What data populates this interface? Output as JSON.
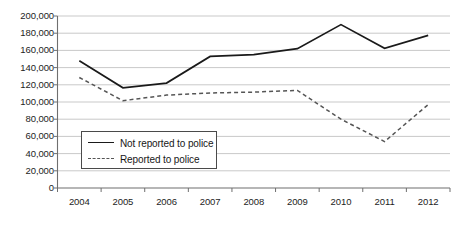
{
  "chart_data": {
    "type": "line",
    "title": "",
    "xlabel": "",
    "ylabel": "",
    "categories": [
      "2004",
      "2005",
      "2006",
      "2007",
      "2008",
      "2009",
      "2010",
      "2011",
      "2012"
    ],
    "x": [
      2004,
      2005,
      2006,
      2007,
      2008,
      2009,
      2010,
      2011,
      2012
    ],
    "ylim": [
      0,
      200000
    ],
    "ytick_step": 20000,
    "yticks": [
      "200,000",
      "180,000",
      "160,000",
      "140,000",
      "120,000",
      "100,000",
      "80,000",
      "60,000",
      "40,000",
      "20,000",
      "0"
    ],
    "ytick_values": [
      200000,
      180000,
      160000,
      140000,
      120000,
      100000,
      80000,
      60000,
      40000,
      20000,
      0
    ],
    "grid": true,
    "grid_axis": "y",
    "legend_position": "inside-lower-left",
    "series": [
      {
        "name": "Not reported to police",
        "style": "solid",
        "color": "#1a1a1a",
        "values": [
          148000,
          116500,
          122000,
          153000,
          155000,
          162000,
          190000,
          162500,
          177500
        ]
      },
      {
        "name": "Reported to police",
        "style": "dashed",
        "color": "#555555",
        "values": [
          128500,
          101500,
          108000,
          110500,
          111500,
          113500,
          80000,
          54000,
          97000
        ]
      }
    ]
  },
  "legend": {
    "items": [
      {
        "label": "Not reported to police",
        "style": "solid"
      },
      {
        "label": "Reported to police",
        "style": "dashed"
      }
    ]
  },
  "colors": {
    "grid": "#c9c9c9",
    "axis": "#6f6f6f",
    "series_solid": "#1a1a1a",
    "series_dashed": "#555555",
    "legend_border": "#4a4a4a",
    "text": "#1d1d1d",
    "background": "#ffffff"
  }
}
